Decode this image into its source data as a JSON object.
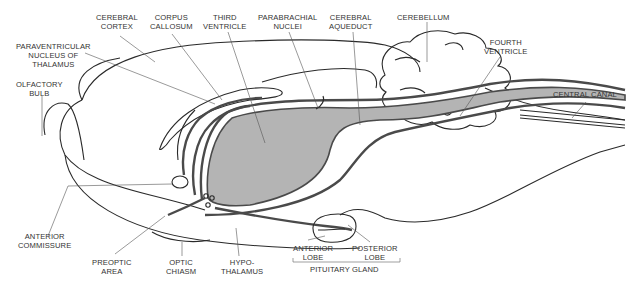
{
  "diagram": {
    "colors": {
      "outline": "#2a2a2a",
      "ventricle_fill": "#b4b4b4",
      "ventricle_wall": "#4a4a4a",
      "label_text": "#333333"
    },
    "labels": {
      "cerebral_cortex": [
        "CEREBRAL",
        "CORTEX"
      ],
      "corpus_callosum": [
        "CORPUS",
        "CALLOSUM"
      ],
      "third_ventricle": [
        "THIRD",
        "VENTRICLE"
      ],
      "parabrachial_nuclei": [
        "PARABRACHIAL",
        "NUCLEI"
      ],
      "cerebral_aqueduct": [
        "CEREBRAL",
        "AQUEDUCT"
      ],
      "cerebellum": [
        "CEREBELLUM"
      ],
      "paraventricular_nucleus": [
        "PARAVENTRICULAR",
        "NUCLEUS OF",
        "THALAMUS"
      ],
      "fourth_ventricle": [
        "FOURTH",
        "VENTRICLE"
      ],
      "olfactory_bulb": [
        "OLFACTORY",
        "BULB"
      ],
      "central_canal": [
        "CENTRAL CANAL"
      ],
      "anterior_commissure": [
        "ANTERIOR",
        "COMMISSURE"
      ],
      "preoptic_area": [
        "PREOPTIC",
        "AREA"
      ],
      "optic_chiasm": [
        "OPTIC",
        "CHIASM"
      ],
      "hypothalamus": [
        "HYPO-",
        "THALAMUS"
      ],
      "anterior_lobe": [
        "ANTERIOR",
        "LOBE"
      ],
      "posterior_lobe": [
        "POSTERIOR",
        "LOBE"
      ],
      "pituitary_gland": [
        "PITUITARY GLAND"
      ]
    }
  }
}
